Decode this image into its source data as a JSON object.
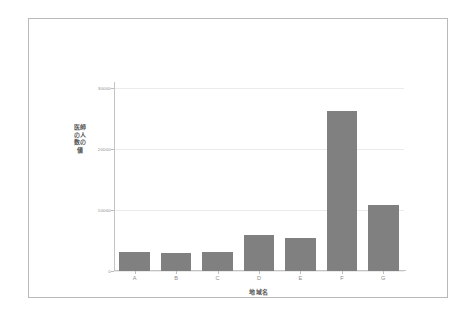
{
  "chart_data": {
    "type": "bar",
    "title": "",
    "xlabel": "地域名",
    "ylabel": "医師の人数の値",
    "categories": [
      "A",
      "B",
      "C",
      "D",
      "E",
      "F",
      "G"
    ],
    "values": [
      3200,
      3000,
      3050,
      5970,
      5480,
      26200,
      10800
    ],
    "ylim": [
      0,
      31000
    ],
    "yticks": [
      0,
      10000,
      20000,
      30000
    ],
    "ytick_labels": [
      "0",
      "10000",
      "20000",
      "30000"
    ],
    "grid": true,
    "legend": "none",
    "bar_color": "#808080",
    "grid_color": "#ebebeb",
    "axis_color": "#c3c3c3",
    "tick_label_color": "#8d8d8d",
    "frame_color": "#b9b9b9",
    "background": "#ffffff"
  }
}
